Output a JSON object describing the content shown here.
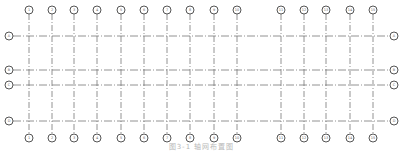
{
  "diagram": {
    "type": "structural-axis-grid",
    "line_color": "#777777",
    "bubble_color": "#555555",
    "columns": [
      {
        "label": "1",
        "x": 29
      },
      {
        "label": "2",
        "x": 52
      },
      {
        "label": "3",
        "x": 74
      },
      {
        "label": "4",
        "x": 97
      },
      {
        "label": "5",
        "x": 121
      },
      {
        "label": "6",
        "x": 144
      },
      {
        "label": "7",
        "x": 167
      },
      {
        "label": "8",
        "x": 190
      },
      {
        "label": "9",
        "x": 214
      },
      {
        "label": "10",
        "x": 237
      },
      {
        "label": "11",
        "x": 281
      },
      {
        "label": "12",
        "x": 304
      },
      {
        "label": "13",
        "x": 326
      },
      {
        "label": "14",
        "x": 350
      },
      {
        "label": "15",
        "x": 373
      }
    ],
    "rows": [
      {
        "label": "A",
        "y": 36
      },
      {
        "label": "B",
        "y": 70
      },
      {
        "label": "C",
        "y": 85
      },
      {
        "label": "D",
        "y": 121
      }
    ],
    "caption": "图3-1 轴网布置图"
  }
}
